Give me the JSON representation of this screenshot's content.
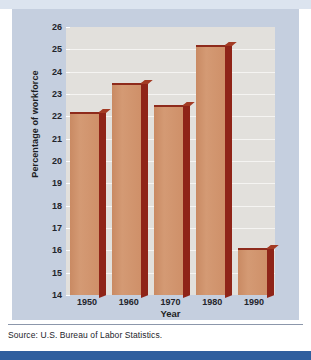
{
  "chart_data": {
    "type": "bar",
    "title": "",
    "categories": [
      "1950",
      "1960",
      "1970",
      "1980",
      "1990"
    ],
    "values": [
      22.2,
      23.5,
      22.5,
      25.2,
      16.1
    ],
    "series": [
      {
        "name": "Percentage of workforce",
        "values": [
          22.2,
          23.5,
          22.5,
          25.2,
          16.1
        ]
      }
    ],
    "xlabel": "Year",
    "ylabel": "Percentage of workforce",
    "ylim": [
      14,
      26
    ],
    "ytick_labels": [
      "26",
      "25",
      "24",
      "23",
      "22",
      "21",
      "20",
      "19",
      "18",
      "17",
      "16",
      "15",
      "14"
    ],
    "ytick_values": [
      26,
      25,
      24,
      23,
      22,
      21,
      20,
      19,
      18,
      17,
      16,
      15,
      14
    ],
    "grid": true,
    "legend": "none",
    "bar_face_color": "#cf9069",
    "bar_side_color": "#8f2418",
    "plot_background": "#e2e0dc",
    "panel_background": "#c5cfdf"
  },
  "source": {
    "text": "Source: U.S. Bureau of Labor Statistics."
  }
}
